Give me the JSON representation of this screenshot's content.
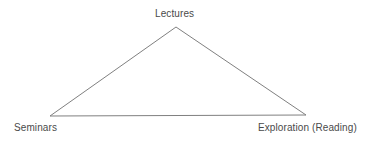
{
  "diagram": {
    "type": "triangle-diagram",
    "shape_name": "triangle",
    "background_color": "#ffffff",
    "line_color": "#808080",
    "line_width": 1,
    "text_color": "#4a4a4a",
    "vertices": [
      {
        "id": "apex",
        "label": "Lectures",
        "x": 176,
        "y": 27
      },
      {
        "id": "bottom-left",
        "label": "Seminars",
        "x": 50,
        "y": 116
      },
      {
        "id": "bottom-right",
        "label": "Exploration (Reading)",
        "x": 306,
        "y": 115
      }
    ],
    "labels": {
      "top": "Lectures",
      "bottom_left": "Seminars",
      "bottom_right": "Exploration (Reading)"
    }
  }
}
